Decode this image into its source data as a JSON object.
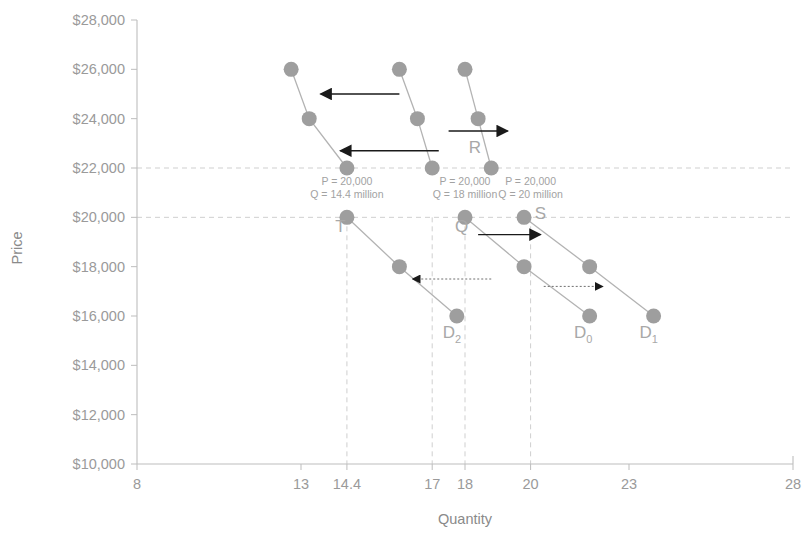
{
  "chart_data": {
    "type": "scatter",
    "title": "",
    "xlabel": "Quantity",
    "ylabel": "Price",
    "xlim": [
      8,
      28
    ],
    "ylim": [
      10000,
      28000
    ],
    "xticks": [
      "8",
      "13",
      "14.4",
      "17",
      "18",
      "20",
      "23",
      "28"
    ],
    "xtick_values": [
      8,
      13,
      14.4,
      17,
      18,
      20,
      23,
      28
    ],
    "yticks": [
      "$10,000",
      "$12,000",
      "$14,000",
      "$16,000",
      "$18,000",
      "$20,000",
      "$22,000",
      "$24,000",
      "$26,000",
      "$28,000"
    ],
    "ytick_values": [
      10000,
      12000,
      14000,
      16000,
      18000,
      20000,
      22000,
      24000,
      26000,
      28000
    ],
    "grid": "dashed-reference-lines",
    "legend": "none",
    "marker_color": "#9e9e9e",
    "line_color": "#b3b3b3",
    "series": [
      {
        "name": "S2",
        "role": "supply-shifted-left",
        "points": [
          {
            "x": 12.7,
            "y": 26000
          },
          {
            "x": 13.25,
            "y": 24000
          },
          {
            "x": 14.4,
            "y": 22000
          }
        ]
      },
      {
        "name": "S0",
        "role": "supply-original",
        "points": [
          {
            "x": 16.0,
            "y": 26000
          },
          {
            "x": 16.55,
            "y": 24000
          },
          {
            "x": 17.0,
            "y": 22000
          }
        ]
      },
      {
        "name": "S1",
        "role": "supply-shifted-right",
        "points": [
          {
            "x": 18.0,
            "y": 26000
          },
          {
            "x": 18.4,
            "y": 24000
          },
          {
            "x": 18.8,
            "y": 22000
          }
        ]
      },
      {
        "name": "D2",
        "role": "demand-shifted-left",
        "points": [
          {
            "x": 14.4,
            "y": 20000
          },
          {
            "x": 16.0,
            "y": 18000
          },
          {
            "x": 17.75,
            "y": 16000
          }
        ]
      },
      {
        "name": "D0",
        "role": "demand-original",
        "points": [
          {
            "x": 18.0,
            "y": 20000
          },
          {
            "x": 19.8,
            "y": 18000
          },
          {
            "x": 21.8,
            "y": 16000
          }
        ]
      },
      {
        "name": "D1",
        "role": "demand-shifted-right",
        "points": [
          {
            "x": 19.8,
            "y": 20000
          },
          {
            "x": 21.8,
            "y": 18000
          },
          {
            "x": 23.75,
            "y": 16000
          }
        ]
      }
    ],
    "equilibrium_annotations": [
      {
        "id": "ann-left",
        "line1": "P = 20,000",
        "line2": "Q = 14.4 million",
        "x": 14.4,
        "y": 21300
      },
      {
        "id": "ann-mid",
        "line1": "P = 20,000",
        "line2": "Q = 18 million",
        "x": 18.0,
        "y": 21300
      },
      {
        "id": "ann-right",
        "line1": "P = 20,000",
        "line2": "Q = 20 million",
        "x": 20.0,
        "y": 21300
      }
    ],
    "point_labels": [
      {
        "id": "label-R",
        "text": "R",
        "x": 18.3,
        "y": 22600
      },
      {
        "id": "label-T",
        "text": "T",
        "x": 14.2,
        "y": 19400
      },
      {
        "id": "label-Q",
        "text": "Q",
        "x": 17.9,
        "y": 19400
      },
      {
        "id": "label-S",
        "text": "S",
        "x": 20.3,
        "y": 19950
      }
    ],
    "curve_labels": [
      {
        "id": "label-D2",
        "base": "D",
        "sub": "2",
        "x": 17.6,
        "y": 15100
      },
      {
        "id": "label-D0",
        "base": "D",
        "sub": "0",
        "x": 21.6,
        "y": 15100
      },
      {
        "id": "label-D1",
        "base": "D",
        "sub": "1",
        "x": 23.6,
        "y": 15100
      }
    ],
    "shift_arrows": [
      {
        "id": "arrow-supply-left-upper",
        "direction": "left",
        "x_from": 16.0,
        "x_to": 13.6,
        "y": 25000,
        "style": "solid"
      },
      {
        "id": "arrow-supply-left-lower",
        "direction": "left",
        "x_from": 17.2,
        "x_to": 14.2,
        "y": 22700,
        "style": "solid"
      },
      {
        "id": "arrow-supply-right",
        "direction": "right",
        "x_from": 17.5,
        "x_to": 19.3,
        "y": 23500,
        "style": "solid"
      },
      {
        "id": "arrow-demand-left",
        "direction": "left",
        "x_from": 18.8,
        "x_to": 16.4,
        "y": 17500,
        "style": "dotted"
      },
      {
        "id": "arrow-demand-right-upper",
        "direction": "right",
        "x_from": 18.4,
        "x_to": 20.3,
        "y": 19300,
        "style": "solid"
      },
      {
        "id": "arrow-demand-right-lower",
        "direction": "right",
        "x_from": 20.4,
        "x_to": 22.2,
        "y": 17200,
        "style": "dotted"
      }
    ],
    "reference_lines": {
      "horizontal": [
        22000,
        20000
      ],
      "vertical": [
        14.4,
        17,
        18,
        20
      ]
    }
  }
}
